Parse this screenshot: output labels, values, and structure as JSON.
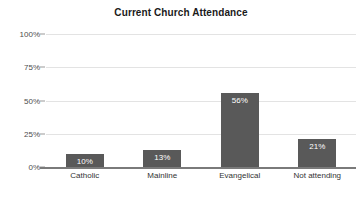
{
  "chart_data": {
    "type": "bar",
    "title": "Current Church Attendance",
    "xlabel": "",
    "ylabel": "",
    "categories": [
      "Catholic",
      "Mainline",
      "Evangelical",
      "Not attending"
    ],
    "values": [
      10,
      13,
      56,
      21
    ],
    "value_labels": [
      "10%",
      "13%",
      "56%",
      "21%"
    ],
    "ylim": [
      0,
      100
    ],
    "yticks": [
      0,
      25,
      50,
      75,
      100
    ],
    "ytick_labels": [
      "0%",
      "25%",
      "50%",
      "75%",
      "100%"
    ],
    "grid": true,
    "legend": false,
    "bar_color": "#595959",
    "gridline_color": "#e3e3e3",
    "axis_color": "#7a7a7a",
    "label_text_color": "#ffffff",
    "title_color": "#1a1a1a"
  }
}
